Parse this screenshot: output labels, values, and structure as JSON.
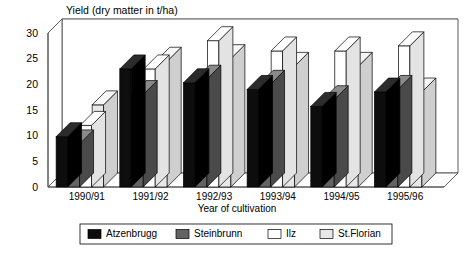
{
  "chart_data": {
    "type": "bar",
    "title": "Yield (dry matter in t/ha)",
    "xlabel": "Year of cultivation",
    "ylabel": "",
    "ylim": [
      0,
      30
    ],
    "yticks": [
      0,
      5,
      10,
      15,
      20,
      25,
      30
    ],
    "ytick_labels": [
      "0",
      "5",
      "10",
      "15",
      "20",
      "25",
      "30"
    ],
    "grid": true,
    "legend_position": "bottom",
    "style": "3d-clustered-columns",
    "categories": [
      "1990/91",
      "1991/92",
      "1992/93",
      "1993/94",
      "1994/95",
      "1995/96"
    ],
    "series": [
      {
        "name": "Atzenbrugg",
        "color": "#0d0d0d",
        "values": [
          9.8,
          23.0,
          20.3,
          19.0,
          15.7,
          18.5
        ]
      },
      {
        "name": "Steinbrunn",
        "color": "#636363",
        "values": [
          8.4,
          18.0,
          21.0,
          20.0,
          17.0,
          19.0
        ]
      },
      {
        "name": "Ilz",
        "color": "#ffffff",
        "values": [
          12.0,
          23.0,
          28.5,
          26.5,
          26.5,
          27.5
        ]
      },
      {
        "name": "St.Florian",
        "color": "#e8e8e8",
        "values": [
          16.0,
          24.5,
          25.0,
          23.5,
          23.5,
          18.5
        ]
      }
    ]
  },
  "legend": {
    "entries": [
      {
        "label": "Atzenbrugg",
        "color": "#0d0d0d"
      },
      {
        "label": "Steinbrunn",
        "color": "#636363"
      },
      {
        "label": "Ilz",
        "color": "#ffffff"
      },
      {
        "label": "St.Florian",
        "color": "#e8e8e8"
      }
    ]
  }
}
